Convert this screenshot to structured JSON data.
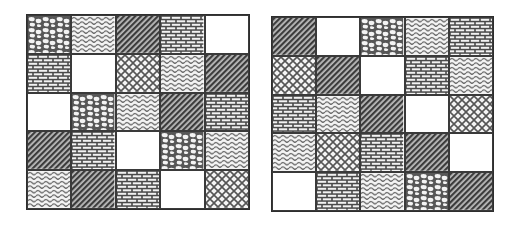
{
  "figure": {
    "pattern_types": {
      "cobble": "irregular rounded white blobs on dark background",
      "wave": "horizontal wavy lines",
      "diagonal": "dense dark diagonal hatching",
      "brick": "brick-wall pattern",
      "blank": "plain white",
      "crosshatch": "diamond lattice / crossed diagonal lines"
    },
    "colors": {
      "line": "#3a3a3a",
      "dark_fill": "#555555",
      "background": "#ffffff"
    }
  },
  "grids": [
    {
      "id": "left",
      "rows": [
        [
          "cobble",
          "wave",
          "diagonal",
          "brick",
          "blank"
        ],
        [
          "brick",
          "blank",
          "crosshatch",
          "wave",
          "diagonal"
        ],
        [
          "blank",
          "cobble",
          "wave",
          "diagonal",
          "brick"
        ],
        [
          "diagonal",
          "brick",
          "blank",
          "cobble",
          "wave"
        ],
        [
          "wave",
          "diagonal",
          "brick",
          "blank",
          "crosshatch"
        ]
      ]
    },
    {
      "id": "right",
      "rows": [
        [
          "diagonal",
          "blank",
          "cobble",
          "wave",
          "brick"
        ],
        [
          "crosshatch",
          "diagonal",
          "blank",
          "brick",
          "wave"
        ],
        [
          "brick",
          "wave",
          "diagonal",
          "blank",
          "crosshatch"
        ],
        [
          "wave",
          "crosshatch",
          "brick",
          "diagonal",
          "blank"
        ],
        [
          "blank",
          "brick",
          "wave",
          "cobble",
          "diagonal"
        ]
      ]
    }
  ]
}
